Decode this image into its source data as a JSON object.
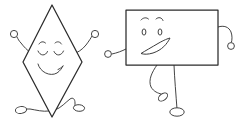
{
  "canvas": {
    "width": 239,
    "height": 124,
    "background_color": "#ffffff",
    "ink_color": "#2b2b2b",
    "title": "Two cartoon shape characters"
  },
  "figures": [
    {
      "id": "diamond-character",
      "shape_name": "rhombus",
      "label": "diamond character",
      "outline_color": "#2b2b2b",
      "fill_color": "#ffffff",
      "vertices": [
        [
          52,
          5
        ],
        [
          82,
          62
        ],
        [
          52,
          117
        ],
        [
          23,
          62
        ]
      ],
      "face": {
        "expression": "happy-closed-eyes",
        "eyebrows": 2,
        "eyes": "closed-arcs",
        "mouth": "smile-with-curl"
      },
      "arms": [
        {
          "side": "left",
          "hand_shape": "circle",
          "hand_center": [
            14,
            34
          ],
          "hand_radius": 3.6
        },
        {
          "side": "right",
          "hand_shape": "circle",
          "hand_center": [
            95,
            34
          ],
          "hand_radius": 3.6
        }
      ],
      "legs": [
        {
          "side": "left",
          "foot_shape": "oval",
          "foot_center": [
            21,
            110
          ]
        },
        {
          "side": "right",
          "foot_shape": "oval",
          "foot_center": [
            79,
            108
          ]
        }
      ]
    },
    {
      "id": "rectangle-character",
      "shape_name": "rectangle",
      "label": "rectangle character",
      "outline_color": "#2b2b2b",
      "fill_color": "#ffffff",
      "bounds": {
        "x": 126,
        "y": 10,
        "width": 92,
        "height": 55
      },
      "face": {
        "expression": "happy-open-mouth",
        "eyebrows": 2,
        "eyes": "open-ovals",
        "mouth": "open-wedge-smile"
      },
      "arms": [
        {
          "side": "left",
          "hand_shape": "circle",
          "hand_center": [
            108,
            54
          ],
          "hand_radius": 3.4
        },
        {
          "side": "right",
          "hand_shape": "circle",
          "hand_center": [
            231,
            46
          ],
          "hand_radius": 3.4
        }
      ],
      "legs": [
        {
          "side": "left",
          "foot_shape": "oval",
          "foot_center": [
            163,
            97
          ],
          "pose": "bent"
        },
        {
          "side": "right",
          "foot_shape": "oval",
          "foot_center": [
            177,
            113
          ],
          "pose": "straight"
        }
      ]
    }
  ]
}
